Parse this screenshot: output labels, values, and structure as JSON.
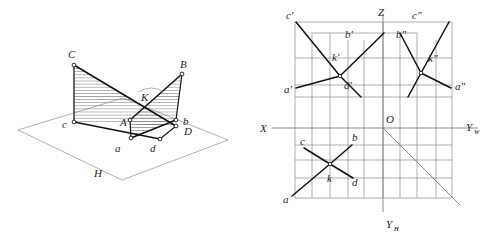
{
  "figure": {
    "background_color": "#ffffff",
    "ink_color": "#111111",
    "thin_line_color": "#7a7a7a"
  },
  "left_figure": {
    "name": "pictorial-view",
    "plane_label": "H",
    "labels": {
      "C": "C",
      "B": "B",
      "K": "K",
      "A": "A",
      "D": "D",
      "c": "c",
      "a": "a",
      "b": "b",
      "d": "d",
      "H": "H"
    },
    "points": {
      "C": [
        74,
        65
      ],
      "B": [
        182,
        74
      ],
      "A": [
        130,
        120
      ],
      "D": [
        176,
        126
      ],
      "c": [
        74,
        122
      ],
      "a": [
        131,
        138
      ],
      "b": [
        176,
        120
      ],
      "d": [
        160,
        139
      ],
      "K": [
        144,
        97
      ]
    },
    "plane_h_corners": [
      [
        18,
        130
      ],
      [
        123,
        98
      ],
      [
        228,
        140
      ],
      [
        122,
        180
      ]
    ]
  },
  "right_figure": {
    "name": "orthographic-projection",
    "axes": {
      "X": "X",
      "Z": "Z",
      "O": "O",
      "Y_W": "Y",
      "Y_W_sub": "W",
      "Y_H": "Y",
      "Y_H_sub": "H"
    },
    "origin": [
      383,
      128
    ],
    "labels": {
      "c_prime": "c'",
      "b_prime": "b'",
      "b_dprime": "b\"",
      "c_dprime": "c\"",
      "k_prime": "k'",
      "k_dprime": "k\"",
      "a_prime": "a'",
      "a_dprime": "a\"",
      "d_prime": "d'",
      "c": "c",
      "b": "b",
      "k": "k",
      "d": "d",
      "a": "a"
    },
    "points": {
      "a_prime": "a'",
      "b_prime": "b'",
      "c_prime": "c'",
      "d_prime": "d'",
      "k_prime": "k'",
      "a_dprime": "a\"",
      "b_dprime": "b\"",
      "c_dprime": "c\"",
      "k_dprime": "k\"",
      "a": "a",
      "b": "b",
      "c": "c",
      "d": "d",
      "k": "k"
    }
  }
}
